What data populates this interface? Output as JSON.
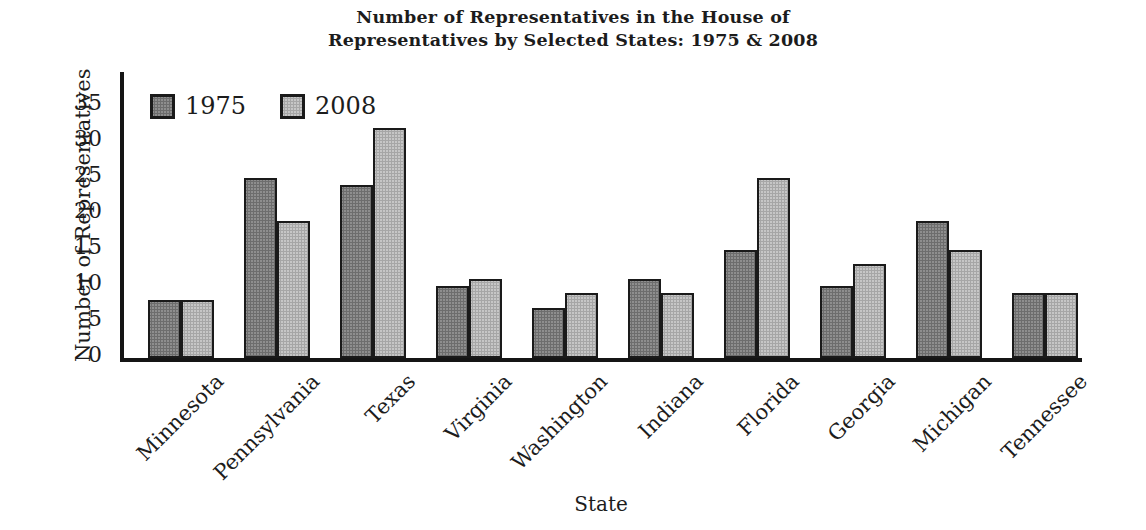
{
  "title": {
    "line1": "Number of Representatives in the House of",
    "line2": "Representatives by Selected States: 1975 & 2008"
  },
  "chart_data": {
    "type": "bar",
    "title": "Number of Representatives in the House of Representatives by Selected States: 1975 & 2008",
    "categories": [
      "Minnesota",
      "Pennsylvania",
      "Texas",
      "Virginia",
      "Washington",
      "Indiana",
      "Florida",
      "Georgia",
      "Michigan",
      "Tennessee"
    ],
    "series": [
      {
        "name": "1975",
        "values": [
          8,
          25,
          24,
          10,
          7,
          11,
          15,
          10,
          19,
          9
        ]
      },
      {
        "name": "2008",
        "values": [
          8,
          19,
          32,
          11,
          9,
          9,
          25,
          13,
          15,
          9
        ]
      }
    ],
    "xlabel": "State",
    "ylabel": "Number of Representatives",
    "ylim": [
      0,
      35
    ],
    "yticks": [
      0,
      5,
      10,
      15,
      20,
      25,
      30,
      35
    ],
    "grid": false,
    "legend_position": "top-left-inside"
  },
  "colors": {
    "bar_1975_fill": "#8e8e8e",
    "bar_1975_dot": "#6d6d6d",
    "bar_2008_fill": "#c6c6c6",
    "bar_2008_dot": "#a6a6a6",
    "axis_outline": "#151515",
    "text": "#1c1c1c"
  }
}
